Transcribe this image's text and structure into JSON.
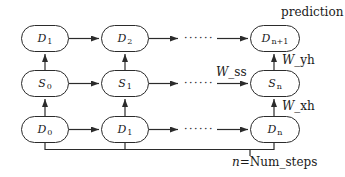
{
  "diagram": {
    "nodes": {
      "top": [
        {
          "main": "D",
          "sub": "1"
        },
        {
          "main": "D",
          "sub": "2"
        },
        {
          "main": "D",
          "sub": "n+1"
        }
      ],
      "middle": [
        {
          "main": "S",
          "sub": "0"
        },
        {
          "main": "S",
          "sub": "1"
        },
        {
          "main": "S",
          "sub": "n"
        }
      ],
      "bottom": [
        {
          "main": "D",
          "sub": "0"
        },
        {
          "main": "D",
          "sub": "1"
        },
        {
          "main": "D",
          "sub": "n"
        }
      ]
    },
    "labels": {
      "prediction": "prediction",
      "w_ss": {
        "var": "W",
        "rest": "_ss"
      },
      "w_yh": {
        "var": "W",
        "rest": "_yh"
      },
      "w_xh": {
        "var": "W",
        "rest": "_xh"
      },
      "num_steps": {
        "var": "n",
        "rest": "=Num_steps"
      }
    },
    "dots": "······",
    "colors": {
      "stroke": "#2b2b2b",
      "text": "#1a1a1a",
      "background": "#ffffff"
    }
  }
}
